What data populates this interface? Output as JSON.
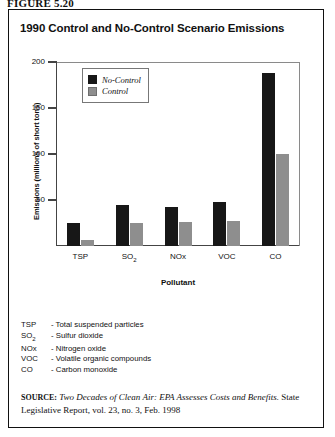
{
  "figure_label": "FIGURE 5.20",
  "chart_title": "1990 Control and No-Control Scenario Emissions",
  "chart_data": {
    "type": "bar",
    "title": "1990 Control and No-Control Scenario Emissions",
    "xlabel": "Pollutant",
    "ylabel": "Emissions (millions of short tons)",
    "ylim": [
      0,
      200
    ],
    "yticks": [
      0,
      50,
      100,
      150,
      200
    ],
    "ytick_labels": [
      "",
      "50",
      "100",
      "150",
      "200"
    ],
    "grid": false,
    "legend_position": "upper-left-inside",
    "categories": [
      "TSP",
      "SO2",
      "NOx",
      "VOC",
      "CO"
    ],
    "category_labels": [
      "TSP",
      "SO",
      "NOx",
      "VOC",
      "CO"
    ],
    "series": [
      {
        "name": "No-Control",
        "color": "#171717",
        "values": [
          25,
          45,
          42,
          48,
          188
        ]
      },
      {
        "name": "Control",
        "color": "#8e8e8e",
        "values": [
          7,
          25,
          26,
          27,
          100
        ]
      }
    ]
  },
  "legend": {
    "items": [
      {
        "label": "No-Control",
        "color": "#171717"
      },
      {
        "label": "Control",
        "color": "#8e8e8e"
      }
    ]
  },
  "axis": {
    "y_label": "Emissions (millions of short tons)",
    "x_label": "Pollutant",
    "y_ticks": [
      "200",
      "150",
      "100",
      "50"
    ]
  },
  "notes": [
    {
      "abbr": "TSP",
      "abbr_sub": "",
      "dash": "-",
      "definition": "Total suspended particles"
    },
    {
      "abbr": "SO",
      "abbr_sub": "2",
      "dash": "-",
      "definition": "Sulfur dioxide"
    },
    {
      "abbr": "NOx",
      "abbr_sub": "",
      "dash": "-",
      "definition": "Nitrogen oxide"
    },
    {
      "abbr": "VOC",
      "abbr_sub": "",
      "dash": "-",
      "definition": "Volatile organic compounds"
    },
    {
      "abbr": "CO",
      "abbr_sub": "",
      "dash": "-",
      "definition": "Carbon monoxide"
    }
  ],
  "source": {
    "kicker": "SOURCE:",
    "title": "Two Decades of Clean Air: EPA Assesses Costs and Benefits.",
    "rest": "State Legislative Report, vol. 23, no. 3, Feb. 1998"
  }
}
